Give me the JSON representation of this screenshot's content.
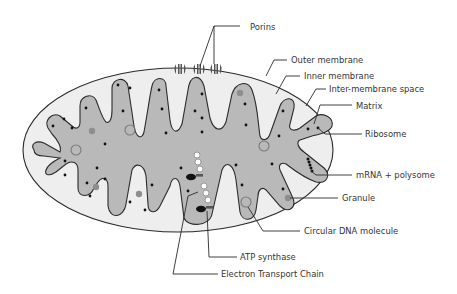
{
  "diagram": {
    "colors": {
      "background": "#ffffff",
      "intermembrane_fill": "#eeeeee",
      "matrix_fill": "#b9b9b9",
      "outline": "#2b2b2b",
      "granule": "#8e8e8e",
      "dna_ring": "#7a7a7a",
      "ribosome": "#111111",
      "label_text": "#333333"
    },
    "labels": {
      "porins": "Porins",
      "outer_membrane": "Outer membrane",
      "inner_membrane": "Inner membrane",
      "intermembrane_space": "Inter-membrane space",
      "matrix": "Matrix",
      "ribosome": "Ribosome",
      "mrna_polysome": "mRNA + polysome",
      "granule": "Granule",
      "circular_dna": "Circular DNA molecule",
      "atp_synthase": "ATP synthase",
      "electron_transport_chain": "Electron Transport Chain"
    }
  }
}
